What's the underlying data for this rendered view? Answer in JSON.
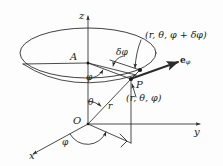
{
  "figure": {
    "background_color": "#fdfdfd",
    "stroke_color": "#2b2b2b",
    "axes": {
      "z_label": "z",
      "y_label": "y",
      "x_label": "x"
    },
    "points": {
      "origin_label": "O",
      "apex_label": "A",
      "point_label": "P"
    },
    "angles": {
      "theta_label": "θ",
      "phi_azimuth_label": "φ",
      "phi_upper_label": "φ",
      "delta_phi_label": "δφ"
    },
    "lengths": {
      "radius_label": "r"
    },
    "coordinates": {
      "point_p": "(r, θ, φ)",
      "point_p_shifted": "(r, θ, φ + δφ)"
    },
    "vectors": {
      "e_phi_base": "e",
      "e_phi_sub": "φ"
    }
  }
}
